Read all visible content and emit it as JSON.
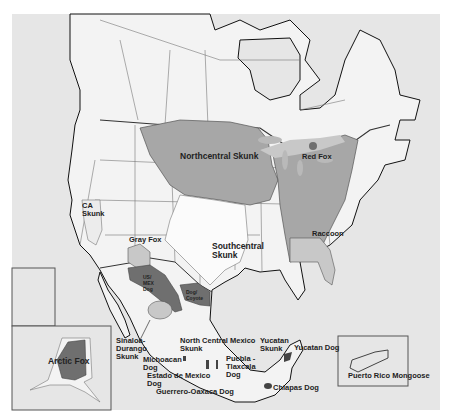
{
  "map": {
    "title": "Rabies reservoir variants in North America",
    "colors": {
      "ocean": "#e6e6e6",
      "land": "#f3f3f3",
      "region_light": "#c8c8c8",
      "region_mid": "#a7a7a7",
      "region_dark": "#6f6f6f",
      "lakes": "#b9b9b9",
      "borders": "#555555",
      "coast": "#111111"
    },
    "labels": {
      "northcentral_skunk": "Northcentral Skunk",
      "red_fox": "Red Fox",
      "ca_skunk": "CA\nSkunk",
      "gray_fox": "Gray Fox",
      "southcentral_skunk": "Southcentral\nSkunk",
      "raccoon": "Raccoon",
      "us_mex_dog": "US/\nMEX\nDog",
      "dog_coyote": "Dog/\nCoyote",
      "arctic_fox": "Arctic Fox",
      "sinaloa_durango_skunk": "Sinaloa-\nDurango\nSkunk",
      "north_central_mexico_skunk": "North Central Mexico\nSkunk",
      "michoacan_dog": "Michoacan\nDog",
      "estado_de_mexico_dog": "Estado de Mexico\nDog",
      "guerrero_oaxaca_dog": "Guerrero-Oaxaca Dog",
      "puebla_tlaxcala_dog": "Puebla -\nTlaxcala\nDog",
      "yucatan_skunk": "Yucatan\nSkunk",
      "yucatan_dog": "Yucatan Dog",
      "chiapas_dog": "Chiapas Dog",
      "puerto_rico_mongoose": "Puerto Rico Mongoose"
    },
    "insets": [
      "Alaska",
      "Hawaii",
      "Puerto Rico"
    ]
  }
}
